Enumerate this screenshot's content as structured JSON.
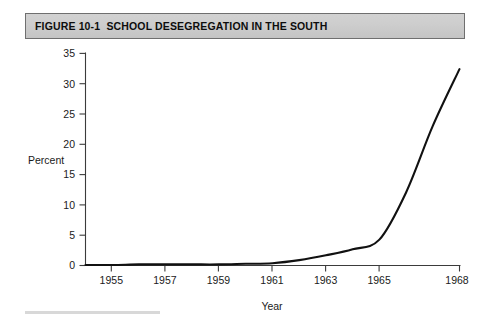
{
  "figure": {
    "title": "FIGURE 10-1  SCHOOL DESEGREGATION IN THE SOUTH",
    "title_bar_color": "#cdcdcd",
    "title_border_color": "#6f6f6f",
    "line_color": "#111111",
    "axis_color": "#3b3b3b",
    "background_color": "#ffffff"
  },
  "chart_data": {
    "type": "line",
    "title": "FIGURE 10-1  SCHOOL DESEGREGATION IN THE SOUTH",
    "subtitle": "",
    "xlabel": "Year",
    "ylabel": "Percent",
    "xlim": [
      1954,
      1968
    ],
    "ylim": [
      0,
      35
    ],
    "grid": false,
    "legend_position": "none",
    "x_ticks": [
      1955,
      1957,
      1959,
      1961,
      1963,
      1965,
      1968
    ],
    "x_tick_labels": [
      "1955",
      "1957",
      "1959",
      "1961",
      "1963",
      "1965",
      "1968"
    ],
    "y_ticks": [
      0,
      5,
      10,
      15,
      20,
      25,
      30,
      35
    ],
    "y_tick_labels": [
      "0",
      "5",
      "10",
      "15",
      "20",
      "25",
      "30",
      "35"
    ],
    "series": [
      {
        "name": "Percent of black students in desegregated schools in the South",
        "x": [
          1954,
          1955,
          1956,
          1957,
          1958,
          1959,
          1960,
          1961,
          1962,
          1963,
          1964,
          1965,
          1966,
          1967,
          1968
        ],
        "values": [
          0.0,
          0.0,
          0.1,
          0.1,
          0.1,
          0.1,
          0.2,
          0.3,
          0.8,
          1.6,
          2.6,
          4.2,
          12.0,
          23.0,
          32.4
        ]
      }
    ],
    "annotations": []
  },
  "axis_titles": {
    "y": "Percent",
    "x": "Year"
  }
}
